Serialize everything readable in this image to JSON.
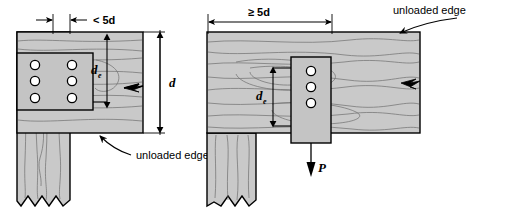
{
  "figure": {
    "colors": {
      "wood_fill": "#c9c9c9",
      "plate_fill": "#c4c4c4",
      "outline": "#000000",
      "grain": "#6e6e6e",
      "bolt_fill": "#ffffff",
      "background": "#ffffff"
    }
  },
  "left_diagram": {
    "name": "close-spacing-case",
    "top_dimension_label": "< 5d",
    "edge_distance_label": "d",
    "edge_distance_subscript": "e",
    "member_depth_label": "d",
    "callout_label": "unloaded edge",
    "bolt_rows": 3,
    "bolt_columns": 2,
    "bolt_count": 6
  },
  "right_diagram": {
    "name": "wide-spacing-case",
    "top_dimension_label": "≥ 5d",
    "edge_distance_label": "d",
    "edge_distance_subscript": "e",
    "callout_label": "unloaded edge",
    "load_label": "P",
    "bolt_rows": 3,
    "bolt_columns": 1,
    "bolt_count": 3
  }
}
